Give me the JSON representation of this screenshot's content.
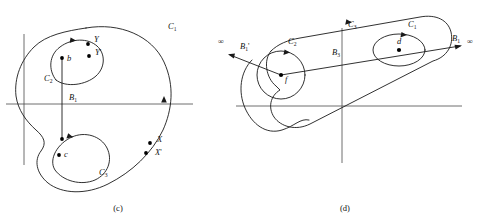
{
  "figure": {
    "captions": [
      {
        "text": "(c)",
        "x": 118,
        "y": 211
      },
      {
        "text": "(d)",
        "x": 345,
        "y": 211
      }
    ]
  },
  "panel_c": {
    "name": "panel-c",
    "labels": {
      "c1": {
        "base": "C",
        "sub": "1",
        "x": 168,
        "y": 29
      },
      "c2": {
        "base": "C",
        "sub": "2",
        "x": 44,
        "y": 81
      },
      "c3": {
        "base": "C",
        "sub": "3",
        "x": 99,
        "y": 175
      },
      "b1": {
        "base": "B",
        "sub": "1",
        "x": 69,
        "y": 100
      },
      "point_b": {
        "base": "b",
        "x": 67,
        "y": 61
      },
      "point_c": {
        "base": "c",
        "x": 64,
        "y": 157
      },
      "y": {
        "base": "Y",
        "x": 94,
        "y": 42
      },
      "y_prime": {
        "base": "Y",
        "prime": "'",
        "x": 95,
        "y": 55
      },
      "x": {
        "base": "X",
        "x": 157,
        "y": 142
      },
      "x_prime": {
        "base": "X",
        "prime": "'",
        "x": 155,
        "y": 155
      }
    },
    "points": [
      {
        "name": "point-b-dot",
        "x": 62,
        "y": 58
      },
      {
        "name": "point-c-dot",
        "x": 59,
        "y": 155
      },
      {
        "name": "point-y-dot",
        "x": 88,
        "y": 44
      },
      {
        "name": "point-y-prime-dot",
        "x": 89,
        "y": 56
      },
      {
        "name": "point-x-dot",
        "x": 150,
        "y": 143
      },
      {
        "name": "point-x-prime-dot",
        "x": 146,
        "y": 153
      }
    ]
  },
  "panel_d": {
    "name": "panel-d",
    "labels": {
      "c1": {
        "base": "C",
        "sub": "1",
        "x": 408,
        "y": 27
      },
      "c2": {
        "base": "C",
        "sub": "2",
        "x": 288,
        "y": 44
      },
      "c3": {
        "base": "C",
        "sub": "3",
        "x": 348,
        "y": 27
      },
      "b1": {
        "base": "B",
        "sub": "1",
        "x": 452,
        "y": 41
      },
      "b1_prime": {
        "base": "B",
        "sub": "1",
        "prime": "'",
        "x": 240,
        "y": 49
      },
      "b3": {
        "base": "B",
        "sub": "3",
        "x": 332,
        "y": 55
      },
      "point_d": {
        "base": "d",
        "x": 399,
        "y": 44
      },
      "point_f": {
        "base": "f",
        "x": 285,
        "y": 82
      },
      "infinity_left": {
        "base": "∞",
        "x": 218,
        "y": 44
      },
      "infinity_right": {
        "base": "∞",
        "x": 467,
        "y": 44
      }
    },
    "points": [
      {
        "name": "point-d-dot",
        "x": 399,
        "y": 50
      },
      {
        "name": "point-f-dot",
        "x": 281,
        "y": 75
      }
    ]
  }
}
